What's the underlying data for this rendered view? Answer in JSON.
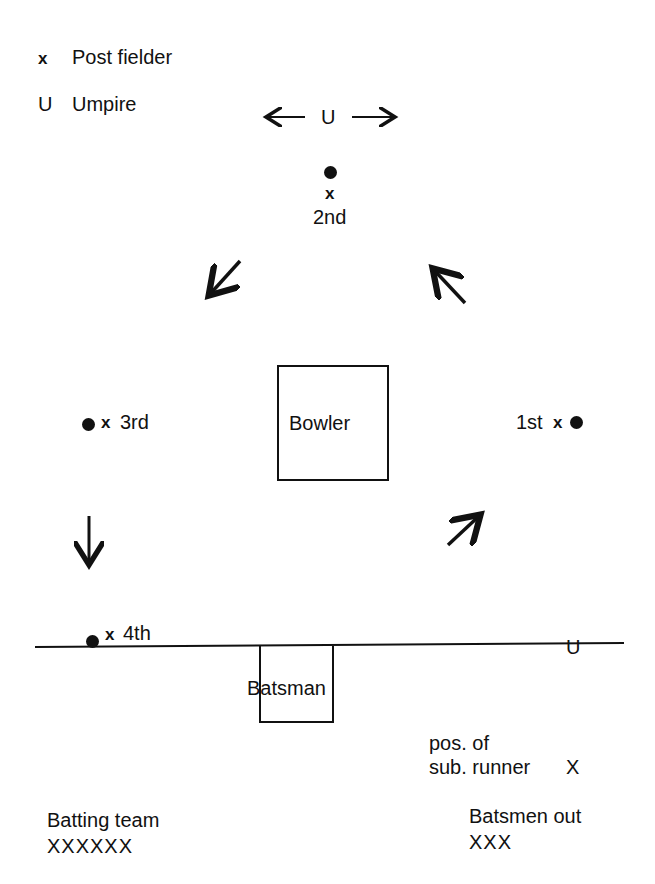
{
  "legend": {
    "fielder_symbol": "x",
    "fielder_label": "Post fielder",
    "umpire_symbol": "U",
    "umpire_label": "Umpire"
  },
  "top_umpire": {
    "left_arrow": "←",
    "symbol": "U",
    "right_arrow": "→"
  },
  "posts": {
    "second": {
      "marker": "x",
      "label": "2nd"
    },
    "third": {
      "marker": "x",
      "label": "3rd"
    },
    "first": {
      "marker": "x",
      "label": "1st"
    },
    "fourth": {
      "marker": "x",
      "label": "4th"
    }
  },
  "bowler_box": {
    "label": "Bowler"
  },
  "batsman_box": {
    "label": "Batsman"
  },
  "line_umpire": {
    "symbol": "U"
  },
  "sub_runner": {
    "line1": "pos. of",
    "line2": "sub. runner",
    "marker": "X"
  },
  "batting_team": {
    "label": "Batting team",
    "players": "XXXXXX"
  },
  "batsmen_out": {
    "label": "Batsmen out",
    "players": "XXX"
  }
}
